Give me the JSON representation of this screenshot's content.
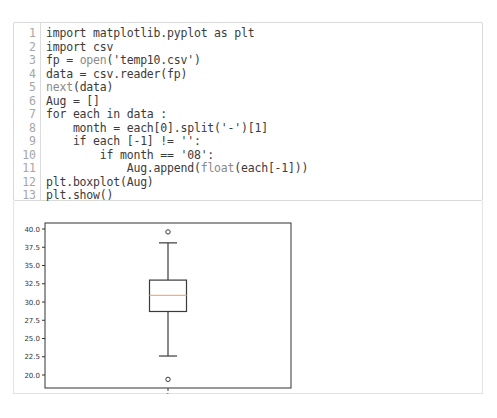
{
  "code_cell": {
    "lines": [
      {
        "no": "1",
        "code": "import matplotlib.pyplot as plt"
      },
      {
        "no": "2",
        "code": "import csv"
      },
      {
        "no": "3",
        "code": "fp = open('temp10.csv')"
      },
      {
        "no": "4",
        "code": "data = csv.reader(fp)"
      },
      {
        "no": "5",
        "code": "next(data)"
      },
      {
        "no": "6",
        "code": "Aug = []"
      },
      {
        "no": "7",
        "code": "for each in data :"
      },
      {
        "no": "8",
        "code": "    month = each[0].split('-')[1]"
      },
      {
        "no": "9",
        "code": "    if each [-1] != '':"
      },
      {
        "no": "10",
        "code": "        if month == '08':"
      },
      {
        "no": "11",
        "code": "            Aug.append(float(each[-1]))"
      },
      {
        "no": "12",
        "code": "plt.boxplot(Aug)"
      },
      {
        "no": "13",
        "code": "plt.show()"
      }
    ]
  },
  "output": {
    "colors": {
      "box": "#3a3a3a",
      "median": "#f0b27a",
      "axis": "#333333"
    }
  },
  "chart_data": {
    "type": "boxplot",
    "title": "",
    "xlabel": "",
    "ylabel": "",
    "categories": [
      "1"
    ],
    "x_tick_labels": [
      "1"
    ],
    "y_tick_labels": [
      "20.0",
      "22.5",
      "25.0",
      "27.5",
      "30.0",
      "32.5",
      "35.0",
      "37.5",
      "40.0"
    ],
    "ylim": [
      18.2,
      40.6
    ],
    "grid": false,
    "series": [
      {
        "name": "Aug",
        "whisker_low": 22.6,
        "q1": 28.7,
        "median": 30.9,
        "q3": 33.0,
        "whisker_high": 38.1,
        "outliers": [
          39.6,
          19.4
        ]
      }
    ]
  }
}
